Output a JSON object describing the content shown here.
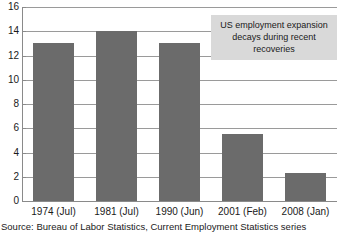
{
  "chart_data": {
    "type": "bar",
    "title": "",
    "subtitle": "",
    "xlabel": "",
    "ylabel": "",
    "categories": [
      "1974 (Jul)",
      "1981 (Jul)",
      "1990 (Jun)",
      "2001 (Feb)",
      "2008 (Jan)"
    ],
    "values": [
      13.0,
      14.0,
      13.0,
      5.5,
      2.3
    ],
    "ylim": [
      0,
      16
    ],
    "ytick_values": [
      0,
      2,
      4,
      6,
      8,
      10,
      12,
      14,
      16
    ],
    "ytick_labels": [
      "0",
      "2",
      "4",
      "6",
      "8",
      "10",
      "12",
      "14",
      "16"
    ],
    "grid": true,
    "grid_axis": "y",
    "legend": false,
    "bar_color": "#6b6b6b",
    "annotations": [
      {
        "lines": [
          "US employment expansion",
          "decays during recent recoveries"
        ],
        "background": "#d9d9d9",
        "position": "top-right"
      }
    ]
  },
  "source": {
    "text": "Source: Bureau of Labor Statistics, Current Employment Statistics series"
  }
}
